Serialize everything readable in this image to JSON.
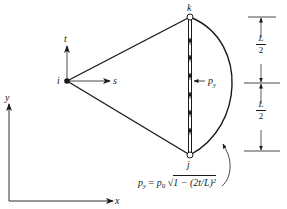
{
  "diagram": {
    "type": "finite element triangle with distributed edge load",
    "nodes": [
      {
        "id": "i",
        "label": "i"
      },
      {
        "id": "k",
        "label": "k"
      },
      {
        "id": "j",
        "label": "j"
      }
    ],
    "local_axes": {
      "s_label": "s",
      "t_label": "t"
    },
    "global_axes": {
      "x_label": "x",
      "y_label": "y"
    },
    "load_label": "p",
    "load_label_sub": "y",
    "dimensions": [
      {
        "numerator": "L",
        "denominator": "2"
      },
      {
        "numerator": "L",
        "denominator": "2"
      }
    ],
    "formula": {
      "lhs": "p",
      "lhs_sub": "y",
      "equals": "=",
      "coef": "p",
      "coef_sub": "0",
      "radical": "√",
      "body": "1 − (2t/L)²"
    },
    "colors": {
      "ink": "#1a1a1a",
      "background": "#ffffff"
    }
  }
}
